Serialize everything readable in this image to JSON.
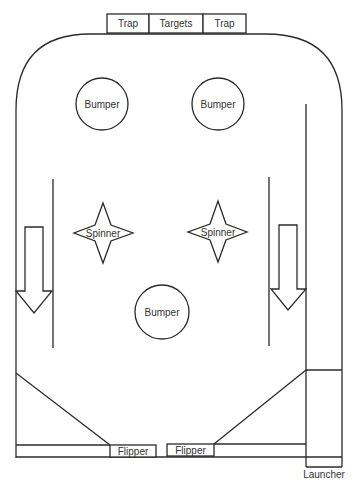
{
  "diagram": {
    "colors": {
      "stroke": "#2b2b2b",
      "text": "#333333",
      "background": "#ffffff"
    },
    "top_targets": [
      {
        "label": "Trap"
      },
      {
        "label": "Targets"
      },
      {
        "label": "Trap"
      }
    ],
    "bumpers": [
      {
        "label": "Bumper",
        "position": "upper-left"
      },
      {
        "label": "Bumper",
        "position": "upper-right"
      },
      {
        "label": "Bumper",
        "position": "center"
      }
    ],
    "spinners": [
      {
        "label": "Spinner",
        "position": "left"
      },
      {
        "label": "Spinner",
        "position": "right"
      }
    ],
    "lanes": [
      {
        "name": "left-lane",
        "arrow": "down"
      },
      {
        "name": "right-lane",
        "arrow": "down"
      }
    ],
    "flippers": [
      {
        "label": "Flipper",
        "position": "left"
      },
      {
        "label": "Flipper",
        "position": "right"
      }
    ],
    "launcher": {
      "label": "Launcher"
    }
  }
}
